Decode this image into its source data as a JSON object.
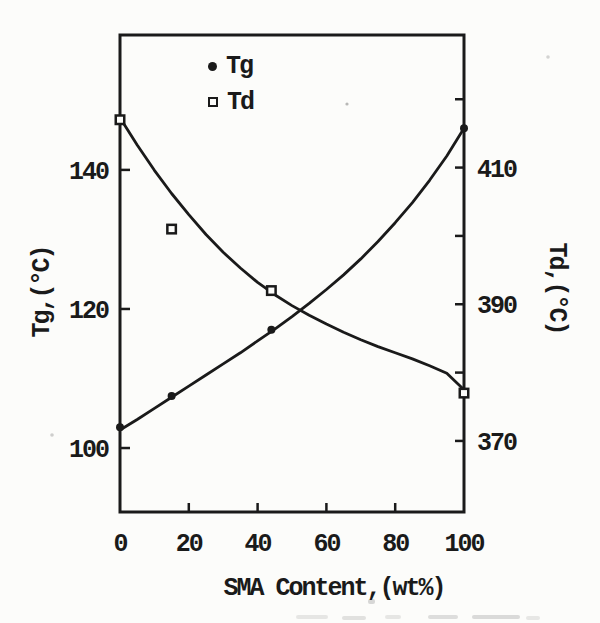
{
  "colors": {
    "ink": "#1a1a1a",
    "paper": "#fcfcfa"
  },
  "chart_data": {
    "type": "scatter",
    "title": "",
    "xlabel": "SMA Content,(wt%)",
    "ylabel_left": "Tg,(°C)",
    "ylabel_right": "Td,(°C)",
    "xlim": [
      0,
      100
    ],
    "x_ticks": [
      0,
      20,
      40,
      60,
      80,
      100
    ],
    "ylim_left": [
      90.8,
      159.4
    ],
    "yticks_left": [
      100,
      120,
      140
    ],
    "ylim_right": [
      359.6,
      429.4
    ],
    "yticks_right_minor": [
      370,
      380,
      390,
      400,
      410,
      420
    ],
    "yticks_right_labeled": [
      370,
      390,
      410
    ],
    "grid": false,
    "legend_position": "top-inside-left",
    "series": [
      {
        "name": "Tg",
        "axis": "left",
        "marker": "filled-circle",
        "x": [
          0,
          15,
          44,
          100
        ],
        "y": [
          103,
          107.5,
          117,
          146
        ],
        "fit_curve": {
          "x": [
            0,
            5,
            10,
            15,
            20,
            25,
            30,
            35,
            40,
            45,
            50,
            55,
            60,
            65,
            70,
            75,
            80,
            85,
            90,
            95,
            100
          ],
          "y": [
            102.6,
            104.1,
            105.7,
            107.3,
            108.9,
            110.5,
            112.1,
            113.7,
            115.4,
            117.1,
            118.9,
            120.8,
            122.8,
            124.9,
            127.2,
            129.7,
            132.4,
            135.3,
            138.5,
            142,
            146
          ]
        }
      },
      {
        "name": "Td",
        "axis": "right",
        "marker": "open-square",
        "x": [
          0,
          15,
          44,
          100
        ],
        "y": [
          417,
          401,
          392,
          377
        ],
        "fit_curve": {
          "x": [
            0,
            5,
            10,
            15,
            20,
            25,
            30,
            35,
            40,
            45,
            50,
            55,
            60,
            65,
            70,
            75,
            80,
            85,
            90,
            95,
            100
          ],
          "y": [
            417.3,
            413.3,
            409.6,
            406.2,
            403.1,
            400.2,
            397.6,
            395.3,
            393.2,
            391.4,
            389.8,
            388.4,
            387.1,
            385.9,
            384.8,
            383.8,
            382.9,
            382,
            381,
            379.9,
            377.5
          ]
        }
      }
    ]
  }
}
